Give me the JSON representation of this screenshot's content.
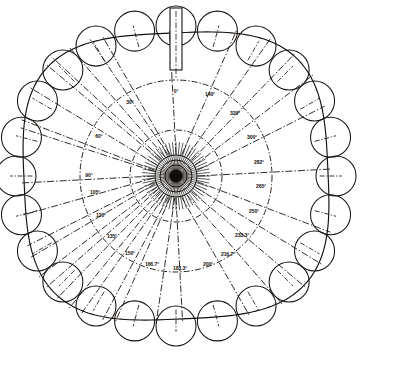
{
  "diagram": {
    "type": "polar-engineering-drawing",
    "center": {
      "x": 176,
      "y": 176
    },
    "shaft": {
      "name": "vertical-probe-shaft",
      "x": 170,
      "y": 8,
      "width": 12,
      "height": 62
    },
    "hub": {
      "core_radius": 6.5,
      "rings": [
        11,
        16,
        21
      ],
      "burst_spoke_count": 60
    },
    "rings": {
      "inner_ring_radius": 46,
      "outer_ring_radius": 96,
      "boundary_label": "outer-cam-outline"
    },
    "outline": {
      "radius_x": 152,
      "radius_y": 143,
      "squareness": 0.62
    },
    "rollers": {
      "count": 24,
      "radius": 20,
      "orbit_radius_x": 160,
      "orbit_radius_y": 150
    },
    "angle_labels": [
      {
        "text": "0°",
        "value": 0,
        "x": 176,
        "y": 92,
        "spoke_angle": 0
      },
      {
        "text": "30°",
        "value": 30,
        "x": 130,
        "y": 103,
        "spoke_angle": -30
      },
      {
        "text": "60°",
        "value": 60,
        "x": 99,
        "y": 137,
        "spoke_angle": -60
      },
      {
        "text": "90°",
        "value": 90,
        "x": 89,
        "y": 176,
        "spoke_angle": -90
      },
      {
        "text": "105°",
        "value": 105,
        "x": 95,
        "y": 193,
        "spoke_angle": -105
      },
      {
        "text": "120°",
        "value": 120,
        "x": 101,
        "y": 216,
        "spoke_angle": -120
      },
      {
        "text": "135°",
        "value": 135,
        "x": 112,
        "y": 237,
        "spoke_angle": -135
      },
      {
        "text": "150°",
        "value": 150,
        "x": 130,
        "y": 254,
        "spoke_angle": -150
      },
      {
        "text": "166.7°",
        "value": 166.7,
        "x": 152,
        "y": 265,
        "spoke_angle": -166.7
      },
      {
        "text": "183.3°",
        "value": 183.3,
        "x": 180,
        "y": 269,
        "spoke_angle": -183.3
      },
      {
        "text": "200°",
        "value": 200,
        "x": 208,
        "y": 265,
        "spoke_angle": -200
      },
      {
        "text": "216.7°",
        "value": 216.7,
        "x": 228,
        "y": 255,
        "spoke_angle": -216.7
      },
      {
        "text": "233.3°",
        "value": 233.3,
        "x": 242,
        "y": 236,
        "spoke_angle": -233.3
      },
      {
        "text": "250°",
        "value": 250,
        "x": 254,
        "y": 212,
        "spoke_angle": -250
      },
      {
        "text": "265°",
        "value": 265,
        "x": 261,
        "y": 187,
        "spoke_angle": -265
      },
      {
        "text": "282°",
        "value": 282,
        "x": 259,
        "y": 163,
        "spoke_angle": -282
      },
      {
        "text": "300°",
        "value": 300,
        "x": 252,
        "y": 138,
        "spoke_angle": -300
      },
      {
        "text": "320°",
        "value": 320,
        "x": 235,
        "y": 114,
        "spoke_angle": -320
      },
      {
        "text": "140°",
        "value": 140,
        "x": 210,
        "y": 95,
        "spoke_angle": -340
      }
    ],
    "colors": {
      "line": "#17130f",
      "label": "#12100f",
      "background": "#ffffff"
    }
  }
}
